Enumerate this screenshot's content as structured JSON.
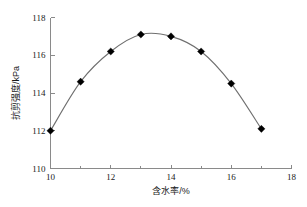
{
  "chart_data": {
    "type": "line",
    "title": "",
    "xlabel": "含水率/%",
    "ylabel": "抗剪强度/kPa",
    "xlim": [
      10,
      18
    ],
    "ylim": [
      110,
      118
    ],
    "x_major_ticks": [
      10,
      12,
      14,
      16,
      18
    ],
    "x_minor_ticks": [
      11,
      13,
      15,
      17
    ],
    "y_ticks": [
      110,
      112,
      114,
      116,
      118
    ],
    "x_tick_labels": [
      "10",
      "12",
      "14",
      "16",
      "18"
    ],
    "y_tick_labels": [
      "110",
      "112",
      "114",
      "116",
      "118"
    ],
    "grid": false,
    "legend": null,
    "marker": "diamond",
    "marker_color": "#000000",
    "line_color": "#6f6f6f",
    "x": [
      10,
      11,
      12,
      13,
      14,
      15,
      16,
      17
    ],
    "values": [
      112.0,
      114.6,
      116.2,
      117.1,
      117.0,
      116.2,
      114.5,
      112.1
    ],
    "series": [
      {
        "name": "抗剪强度",
        "x": [
          10,
          11,
          12,
          13,
          14,
          15,
          16,
          17
        ],
        "values": [
          112.0,
          114.6,
          116.2,
          117.1,
          117.0,
          116.2,
          114.5,
          112.1
        ]
      }
    ]
  },
  "axes": {
    "x_title": "含水率/%",
    "y_title": "抗剪强度/kPa"
  },
  "ticks": {
    "x": [
      "10",
      "12",
      "14",
      "16",
      "18"
    ],
    "y": [
      "110",
      "112",
      "114",
      "116",
      "118"
    ]
  }
}
